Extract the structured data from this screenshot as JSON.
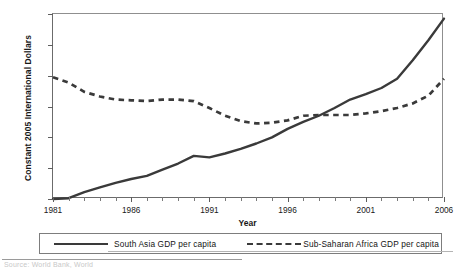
{
  "chart_data": {
    "type": "line",
    "title": "",
    "xlabel": "Year",
    "ylabel": "Constant 2005 International Dollars",
    "xlim": [
      1981,
      2006
    ],
    "ylim": [
      900,
      2100
    ],
    "ytick_labels": [
      "900",
      "1,100",
      "1,300",
      "1,500",
      "1,700",
      "1,900",
      "2,100"
    ],
    "ytick_values": [
      900,
      1100,
      1300,
      1500,
      1700,
      1900,
      2100
    ],
    "xtick_labels": [
      "1981",
      "1986",
      "1991",
      "1996",
      "2001",
      "2006"
    ],
    "xtick_values": [
      1981,
      1986,
      1991,
      1996,
      2001,
      2006
    ],
    "minor_xticks": "annual",
    "grid": false,
    "legend_position": "below-axes",
    "x": [
      1981,
      1982,
      1983,
      1984,
      1985,
      1986,
      1987,
      1988,
      1989,
      1990,
      1991,
      1992,
      1993,
      1994,
      1995,
      1996,
      1997,
      1998,
      1999,
      2000,
      2001,
      2002,
      2003,
      2004,
      2005,
      2006
    ],
    "series": [
      {
        "name": "South Asia GDP per capita",
        "style": "solid",
        "color": "#3a3a3a",
        "values": [
          900,
          905,
          945,
          975,
          1005,
          1030,
          1050,
          1090,
          1130,
          1180,
          1170,
          1195,
          1225,
          1260,
          1300,
          1355,
          1400,
          1440,
          1490,
          1545,
          1580,
          1620,
          1680,
          1800,
          1930,
          2070
        ]
      },
      {
        "name": "Sub-Saharan Africa GDP per capita",
        "style": "dashed",
        "color": "#3a3a3a",
        "values": [
          1690,
          1655,
          1595,
          1565,
          1545,
          1540,
          1535,
          1545,
          1545,
          1535,
          1490,
          1440,
          1405,
          1390,
          1395,
          1410,
          1440,
          1445,
          1445,
          1445,
          1455,
          1470,
          1490,
          1520,
          1570,
          1680
        ]
      }
    ]
  },
  "legend": {
    "entries": [
      {
        "label": "South Asia GDP per capita",
        "style": "solid"
      },
      {
        "label": "Sub-Saharan Africa GDP per capita",
        "style": "dashed"
      }
    ]
  },
  "footer": {
    "source_text": "Source:  World Bank, World"
  }
}
